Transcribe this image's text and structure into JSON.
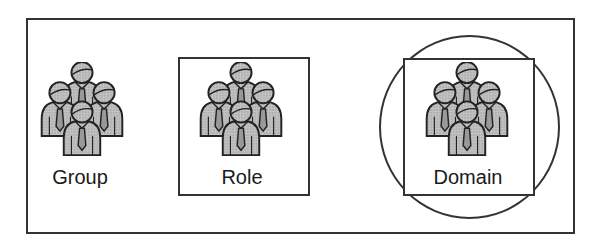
{
  "diagram": {
    "title": "",
    "items": [
      {
        "label": "Group",
        "container": "none",
        "icon": "people-group-icon"
      },
      {
        "label": "Role",
        "container": "square",
        "icon": "people-group-icon"
      },
      {
        "label": "Domain",
        "container": "square-inside-circle",
        "icon": "people-group-icon"
      }
    ],
    "colors": {
      "stroke": "#333333",
      "figure_fill": "#b8b8b8",
      "background": "#ffffff"
    }
  }
}
